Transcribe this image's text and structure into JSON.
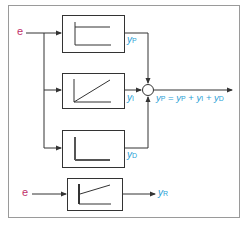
{
  "diagram": {
    "colors": {
      "input": "#c0306a",
      "output": "#2a9fd6",
      "lines": "#333333",
      "frame": "#9a9a9a"
    },
    "input_label": "e",
    "blocks": [
      {
        "id": "P",
        "response": "step",
        "output_label": "y",
        "output_sub": "P"
      },
      {
        "id": "I",
        "response": "ramp",
        "output_label": "y",
        "output_sub": "I"
      },
      {
        "id": "D",
        "response": "impulse",
        "output_label": "y",
        "output_sub": "D"
      }
    ],
    "sum_output": {
      "lhs": "y",
      "lhs_sub": "P",
      "eq": "=",
      "terms": [
        {
          "var": "y",
          "sub": "P"
        },
        {
          "var": "y",
          "sub": "I"
        },
        {
          "var": "y",
          "sub": "D"
        }
      ],
      "plus": "+"
    },
    "equivalent": {
      "input_label": "e",
      "response": "pid",
      "output_label": "y",
      "output_sub": "R"
    }
  }
}
